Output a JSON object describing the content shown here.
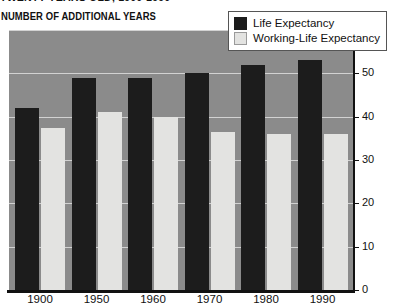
{
  "header": {
    "title": "TWENTY YEARS OLD, 1900-1990",
    "unit_label": "NUMBER OF ADDITIONAL YEARS"
  },
  "legend": {
    "items": [
      {
        "label": "Life Expectancy",
        "color": "#1c1c1c",
        "key": "life"
      },
      {
        "label": "Working-Life Expectancy",
        "color": "#e3e3e1",
        "key": "working"
      }
    ]
  },
  "chart_data": {
    "type": "bar",
    "title": "TWENTY YEARS OLD, 1900-1990",
    "xlabel": "",
    "ylabel": "NUMBER OF ADDITIONAL YEARS",
    "ylim": [
      0,
      60
    ],
    "yticks": [
      0,
      10,
      20,
      30,
      40,
      50,
      60
    ],
    "ytick_labels": [
      "0",
      "10",
      "20",
      "30",
      "40",
      "50",
      "60"
    ],
    "grid": true,
    "y_axis_position": "right",
    "legend_position": "top-right",
    "categories": [
      "1900",
      "1950",
      "1960",
      "1970",
      "1980",
      "1990"
    ],
    "series": [
      {
        "name": "Life Expectancy",
        "color": "#1c1c1c",
        "values": [
          42,
          49,
          49,
          50,
          52,
          53
        ]
      },
      {
        "name": "Working-Life Expectancy",
        "color": "#e3e3e1",
        "values": [
          37.5,
          41,
          40,
          36.5,
          36,
          36
        ]
      }
    ]
  }
}
